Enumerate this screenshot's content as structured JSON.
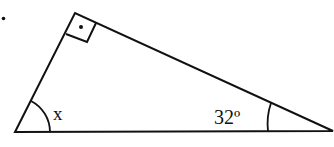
{
  "diagram": {
    "type": "right-triangle",
    "bullet_marker": "•",
    "labels": {
      "angle_x": "x",
      "angle_given": "32º"
    },
    "angles": {
      "right_angle_vertex": "top",
      "right_angle_marker": "square-with-dot",
      "left_vertex": "x",
      "right_vertex": "32º"
    },
    "colors": {
      "stroke": "#111111",
      "background": "#ffffff"
    }
  }
}
